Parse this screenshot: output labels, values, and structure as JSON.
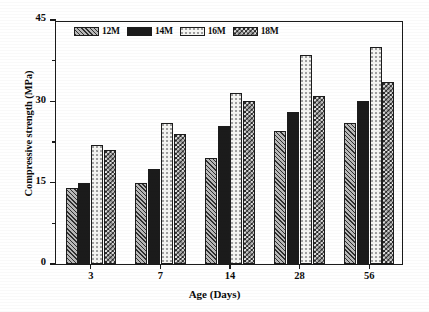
{
  "chart_data": {
    "type": "bar",
    "title": "",
    "xlabel": "Age (Days)",
    "ylabel": "Compressive strength (MPa)",
    "categories": [
      "3",
      "7",
      "14",
      "28",
      "56"
    ],
    "ylim": [
      0,
      45
    ],
    "yticks": [
      0,
      15,
      30,
      45
    ],
    "yminorticks": [
      7.5,
      22.5,
      37.5
    ],
    "grid": false,
    "legend_position": "top-left-inside",
    "series": [
      {
        "name": "12M",
        "pattern": "diagonal-hatch",
        "values": [
          14,
          15,
          19.5,
          24.5,
          26
        ]
      },
      {
        "name": "14M",
        "pattern": "solid-black",
        "values": [
          15,
          17.5,
          25.5,
          28,
          30
        ]
      },
      {
        "name": "16M",
        "pattern": "fine-dots",
        "values": [
          22,
          26,
          31.5,
          38.5,
          40
        ]
      },
      {
        "name": "18M",
        "pattern": "checkerboard",
        "values": [
          21,
          24,
          30,
          31,
          33.5
        ]
      }
    ]
  },
  "colors": {
    "axis": "#1a1a1a",
    "text": "#0b0b0b",
    "background": "#ffffff"
  }
}
